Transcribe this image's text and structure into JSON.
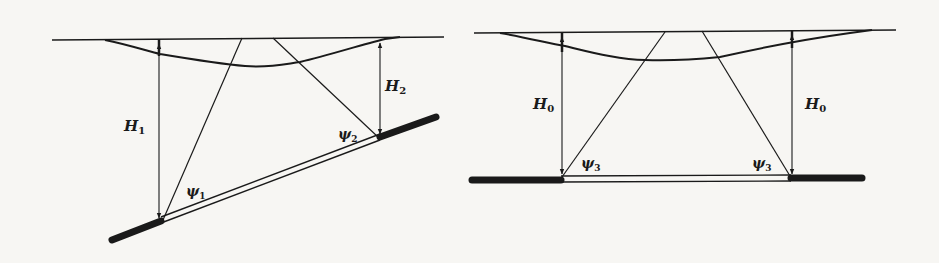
{
  "figure": {
    "type": "geologic-cross-section",
    "panels": [
      {
        "id": "inclined-bed",
        "labels": {
          "h_left": {
            "main": "H",
            "sub": "1"
          },
          "h_right": {
            "main": "H",
            "sub": "2"
          },
          "psi_left": {
            "main": "ψ",
            "sub": "1"
          },
          "psi_right": {
            "main": "ψ",
            "sub": "2"
          }
        }
      },
      {
        "id": "horizontal-bed",
        "labels": {
          "h_left": {
            "main": "H",
            "sub": "0"
          },
          "h_right": {
            "main": "H",
            "sub": "0"
          },
          "psi_left": {
            "main": "ψ",
            "sub": "3"
          },
          "psi_right": {
            "main": "ψ",
            "sub": "3"
          }
        }
      }
    ]
  },
  "colors": {
    "ink": "#1a1a1a",
    "paper": "#f7f6f3"
  }
}
